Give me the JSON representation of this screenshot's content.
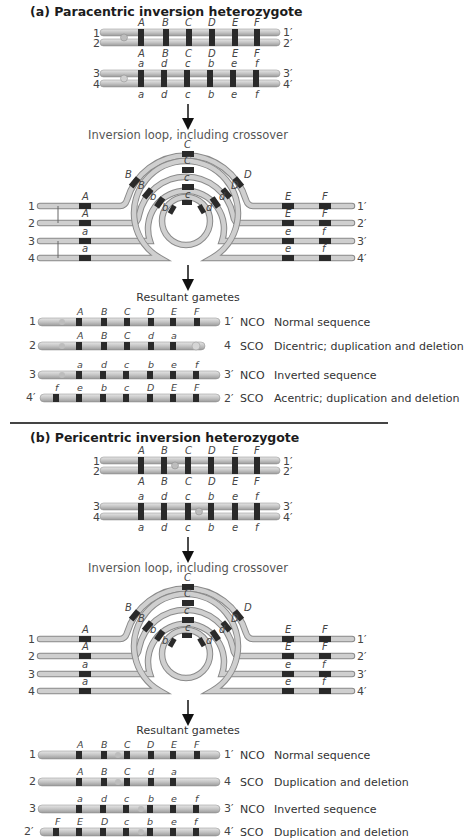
{
  "panel_a": {
    "title": "(a) Paracentric inversion heterozygote",
    "pair_top": {
      "labels_left": [
        "1",
        "2"
      ],
      "labels_right": [
        "1′",
        "2′"
      ],
      "genes_top": [
        "A",
        "B",
        "C",
        "D",
        "E",
        "F"
      ],
      "genes_bottom": [
        "A",
        "B",
        "C",
        "D",
        "E",
        "F"
      ]
    },
    "pair_bottom": {
      "labels_left": [
        "3",
        "4"
      ],
      "labels_right": [
        "3′",
        "4′"
      ],
      "genes_top": [
        "a",
        "d",
        "c",
        "b",
        "e",
        "f"
      ],
      "genes_bottom": [
        "a",
        "d",
        "c",
        "b",
        "e",
        "f"
      ]
    },
    "loop_caption": "Inversion loop, including crossover",
    "loop": {
      "labels_left": [
        "1",
        "2",
        "3",
        "4"
      ],
      "labels_right": [
        "1′",
        "2′",
        "3′",
        "4′"
      ],
      "gene_A": [
        "A",
        "A",
        "a",
        "a"
      ],
      "gene_E": [
        "E",
        "E",
        "e",
        "e"
      ],
      "gene_F": [
        "F",
        "F",
        "f",
        "f"
      ],
      "outer_arc": [
        "B",
        "C",
        "D"
      ],
      "second_arc": [
        "B",
        "C",
        "D"
      ],
      "third_arc": [
        "b",
        "c",
        "d"
      ],
      "inner_arc": [
        "b",
        "c",
        "d"
      ]
    },
    "resultant_caption": "Resultant gametes",
    "gametes": [
      {
        "left": "1",
        "right": "1′",
        "genes": [
          "A",
          "B",
          "C",
          "D",
          "E",
          "F"
        ],
        "type": "NCO",
        "desc": "Normal sequence"
      },
      {
        "left": "2",
        "right": "4",
        "genes": [
          "A",
          "B",
          "C",
          "d",
          "a"
        ],
        "type": "SCO",
        "desc": "Dicentric; duplication and deletion"
      },
      {
        "left": "3",
        "right": "3′",
        "genes": [
          "a",
          "d",
          "c",
          "b",
          "e",
          "f"
        ],
        "type": "NCO",
        "desc": "Inverted sequence"
      },
      {
        "left": "4′",
        "right": "2′",
        "genes": [
          "f",
          "e",
          "b",
          "c",
          "D",
          "E",
          "F"
        ],
        "type": "SCO",
        "desc": "Acentric; duplication and deletion"
      }
    ]
  },
  "panel_b": {
    "title": "(b) Pericentric inversion heterozygote",
    "pair_top": {
      "labels_left": [
        "1",
        "2"
      ],
      "labels_right": [
        "1′",
        "2′"
      ],
      "genes_top": [
        "A",
        "B",
        "C",
        "D",
        "E",
        "F"
      ],
      "genes_bottom": [
        "A",
        "B",
        "C",
        "D",
        "E",
        "F"
      ]
    },
    "pair_bottom": {
      "labels_left": [
        "3",
        "4"
      ],
      "labels_right": [
        "3′",
        "4′"
      ],
      "genes_top": [
        "a",
        "d",
        "c",
        "b",
        "e",
        "f"
      ],
      "genes_bottom": [
        "a",
        "d",
        "c",
        "b",
        "e",
        "f"
      ]
    },
    "loop_caption": "Inversion loop, including crossover",
    "loop": {
      "labels_left": [
        "1",
        "2",
        "3",
        "4"
      ],
      "labels_right": [
        "1′",
        "2′",
        "3′",
        "4′"
      ],
      "gene_A": [
        "A",
        "A",
        "a",
        "a"
      ],
      "gene_E": [
        "E",
        "E",
        "e",
        "e"
      ],
      "gene_F": [
        "F",
        "F",
        "f",
        "f"
      ],
      "outer_arc": [
        "B",
        "C",
        "D"
      ],
      "second_arc": [
        "B",
        "C",
        "D"
      ],
      "third_arc": [
        "b",
        "c",
        "d"
      ],
      "inner_arc": [
        "b",
        "c",
        "d"
      ]
    },
    "resultant_caption": "Resultant gametes",
    "gametes": [
      {
        "left": "1",
        "right": "1′",
        "genes": [
          "A",
          "B",
          "C",
          "D",
          "E",
          "F"
        ],
        "type": "NCO",
        "desc": "Normal sequence"
      },
      {
        "left": "2",
        "right": "4",
        "genes": [
          "A",
          "B",
          "C",
          "d",
          "a"
        ],
        "type": "SCO",
        "desc": "Duplication and deletion"
      },
      {
        "left": "3",
        "right": "3′",
        "genes": [
          "a",
          "d",
          "c",
          "b",
          "e",
          "f"
        ],
        "type": "NCO",
        "desc": "Inverted sequence"
      },
      {
        "left": "2′",
        "right": "4′",
        "genes": [
          "F",
          "E",
          "D",
          "c",
          "b",
          "e",
          "f"
        ],
        "type": "SCO",
        "desc": "Duplication and deletion"
      }
    ]
  },
  "colors": {
    "chromosome_fill": "#c9c9c9",
    "chromosome_edge": "#8a8a8a",
    "band": "#2a2a2a",
    "text": "#333333",
    "divider": "#444444"
  }
}
